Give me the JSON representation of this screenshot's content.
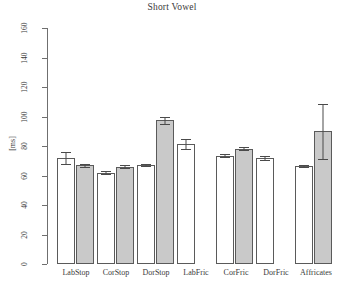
{
  "chart_data": {
    "type": "bar",
    "title": "Short Vowel",
    "xlabel": "",
    "ylabel": "[ms]",
    "ylim": [
      0,
      160
    ],
    "yticks": [
      0,
      20,
      40,
      60,
      80,
      100,
      120,
      140,
      160
    ],
    "grid": false,
    "legend": "none",
    "categories": [
      "LabStop",
      "CorStop",
      "DorStop",
      "LabFric",
      "CorFric",
      "DorFric",
      "Affricates"
    ],
    "series": [
      {
        "name": "white",
        "fill": "#ffffff",
        "values": [
          72,
          62,
          67,
          81.5,
          73.5,
          72,
          66.5
        ],
        "errors": [
          4.0,
          0.8,
          0.8,
          3.5,
          0.8,
          1.2,
          0.8
        ]
      },
      {
        "name": "gray",
        "fill": "#c9c9c9",
        "values": [
          67,
          66,
          97.5,
          null,
          78,
          null,
          90
        ],
        "errors": [
          1.0,
          0.8,
          2.5,
          null,
          1.0,
          null,
          18.5
        ]
      }
    ],
    "bars": [
      {
        "category": "LabStop",
        "series": "white",
        "value": 72,
        "error": 4.0,
        "x": 57,
        "width": 18
      },
      {
        "category": "LabStop",
        "series": "gray",
        "value": 67,
        "error": 1.0,
        "x": 76,
        "width": 18
      },
      {
        "category": "CorStop",
        "series": "white",
        "value": 62,
        "error": 0.8,
        "x": 97,
        "width": 18
      },
      {
        "category": "CorStop",
        "series": "gray",
        "value": 66,
        "error": 0.8,
        "x": 116,
        "width": 18
      },
      {
        "category": "DorStop",
        "series": "white",
        "value": 67,
        "error": 0.8,
        "x": 137,
        "width": 18
      },
      {
        "category": "DorStop",
        "series": "gray",
        "value": 97.5,
        "error": 2.5,
        "x": 156,
        "width": 18
      },
      {
        "category": "LabFric",
        "series": "white",
        "value": 81.5,
        "error": 3.5,
        "x": 177,
        "width": 18
      },
      {
        "category": "CorFric",
        "series": "white",
        "value": 73.5,
        "error": 0.8,
        "x": 216,
        "width": 18
      },
      {
        "category": "CorFric",
        "series": "gray",
        "value": 78,
        "error": 1.0,
        "x": 235,
        "width": 18
      },
      {
        "category": "DorFric",
        "series": "white",
        "value": 72,
        "error": 1.2,
        "x": 256,
        "width": 18
      },
      {
        "category": "Affricates",
        "series": "white",
        "value": 66.5,
        "error": 0.8,
        "x": 295,
        "width": 18
      },
      {
        "category": "Affricates",
        "series": "gray",
        "value": 90,
        "error": 18.5,
        "x": 314,
        "width": 18
      }
    ],
    "category_label_x": [
      76,
      116,
      156,
      196,
      236,
      276,
      316
    ]
  },
  "colors": {
    "bar_white": "#ffffff",
    "bar_gray": "#c9c9c9",
    "bar_border": "#5a5a5a",
    "axis": "#6f6f6f",
    "text": "#3a3a3a",
    "background": "#ffffff"
  }
}
